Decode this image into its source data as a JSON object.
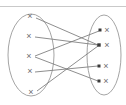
{
  "figure": {
    "kind": "set-mapping-diagram",
    "title_text": "",
    "width": 126,
    "height": 105,
    "background_color": "#ffffff",
    "stroke_color": "#7a7a7a",
    "mark_color": "#6e6e6e",
    "arrowhead_color": "#3a3a3a",
    "rule_color": "#c9c9c9"
  },
  "top_rule": {
    "name": "horizontal-rule",
    "y": 6,
    "x1": 0,
    "x2": 126,
    "color": "#c9c9c9",
    "width": 1
  },
  "sets": [
    {
      "id": "domain",
      "label": "",
      "ellipse": {
        "cx": 31,
        "cy": 55,
        "rx": 23,
        "ry": 41
      },
      "elements": [
        {
          "id": "d1",
          "label": "×",
          "x": 30,
          "y": 16
        },
        {
          "id": "d2",
          "label": "×",
          "x": 29,
          "y": 36
        },
        {
          "id": "d3",
          "label": "×",
          "x": 29,
          "y": 56
        },
        {
          "id": "d4",
          "label": "×",
          "x": 30,
          "y": 71
        },
        {
          "id": "d5",
          "label": "×",
          "x": 31,
          "y": 92
        }
      ]
    },
    {
      "id": "codomain",
      "label": "",
      "ellipse": {
        "cx": 104,
        "cy": 55,
        "rx": 17,
        "ry": 40
      },
      "elements": [
        {
          "id": "c1",
          "label": "×",
          "x": 107,
          "y": 30
        },
        {
          "id": "c2",
          "label": "×",
          "x": 107,
          "y": 45
        },
        {
          "id": "c3",
          "label": "×",
          "x": 106,
          "y": 66
        },
        {
          "id": "c4",
          "label": "×",
          "x": 106,
          "y": 81
        }
      ]
    }
  ],
  "arrow_targets": [
    {
      "id": "t1",
      "x": 100,
      "y": 30
    },
    {
      "id": "t2",
      "x": 99,
      "y": 45
    },
    {
      "id": "t3",
      "x": 99,
      "y": 66
    },
    {
      "id": "t4",
      "x": 99,
      "y": 81
    }
  ],
  "mappings": [
    {
      "id": "m1",
      "from": "d1",
      "to": "c2",
      "x1": 36,
      "y1": 18,
      "x2": 98,
      "y2": 45
    },
    {
      "id": "m2",
      "from": "d2",
      "to": "c2",
      "x1": 35,
      "y1": 37,
      "x2": 98,
      "y2": 45
    },
    {
      "id": "m3",
      "from": "d3",
      "to": "c1",
      "x1": 35,
      "y1": 56,
      "x2": 99,
      "y2": 31
    },
    {
      "id": "m4",
      "from": "d3",
      "to": "c4",
      "x1": 35,
      "y1": 57,
      "x2": 98,
      "y2": 81
    },
    {
      "id": "m5",
      "from": "d4",
      "to": "c3",
      "x1": 35,
      "y1": 72,
      "x2": 98,
      "y2": 66
    },
    {
      "id": "m6",
      "from": "d5",
      "to": "c2",
      "x1": 37,
      "y1": 91,
      "x2": 98,
      "y2": 46
    }
  ],
  "crossings": [
    {
      "id": "x1",
      "x": 56,
      "y": 62
    },
    {
      "id": "x2",
      "x": 78,
      "y": 42
    }
  ]
}
